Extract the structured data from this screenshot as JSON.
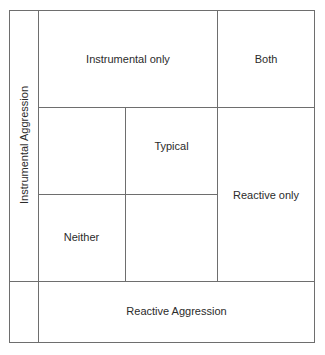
{
  "diagram": {
    "y_axis_label": "Instrumental Aggression",
    "x_axis_label": "Reactive Aggression",
    "cells": {
      "instrumental_only": "Instrumental only",
      "both": "Both",
      "typical": "Typical",
      "reactive_only": "Reactive only",
      "neither": "Neither"
    },
    "line_color": "#6e6e6e"
  }
}
